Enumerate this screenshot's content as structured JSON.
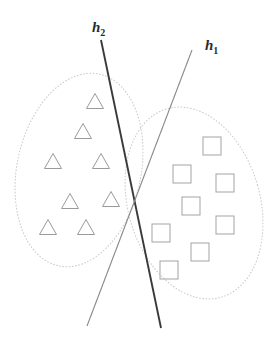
{
  "figure": {
    "width": 266,
    "height": 341,
    "background_color": "#ffffff"
  },
  "chart_data": {
    "type": "scatter",
    "title": "",
    "xlabel": "",
    "ylabel": "",
    "xlim": [
      0,
      266
    ],
    "ylim": [
      0,
      341
    ],
    "grid": false,
    "legend_position": "none",
    "note": "Coordinates are in image pixel space; y increases downward.",
    "series": [
      {
        "name": "class-triangle",
        "marker": "triangle",
        "marker_color": "#9a9a9a",
        "marker_size": 17,
        "points": [
          {
            "x": 95,
            "y": 101
          },
          {
            "x": 83,
            "y": 131
          },
          {
            "x": 53,
            "y": 161
          },
          {
            "x": 101,
            "y": 161
          },
          {
            "x": 70,
            "y": 201
          },
          {
            "x": 111,
            "y": 199
          },
          {
            "x": 48,
            "y": 227
          },
          {
            "x": 86,
            "y": 227
          }
        ]
      },
      {
        "name": "class-square",
        "marker": "square",
        "marker_color": "#a3a3a3",
        "marker_size": 18,
        "points": [
          {
            "x": 212,
            "y": 146
          },
          {
            "x": 182,
            "y": 174
          },
          {
            "x": 225,
            "y": 183
          },
          {
            "x": 191,
            "y": 206
          },
          {
            "x": 225,
            "y": 225
          },
          {
            "x": 161,
            "y": 233
          },
          {
            "x": 200,
            "y": 252
          },
          {
            "x": 169,
            "y": 270
          }
        ]
      }
    ],
    "clusters": [
      {
        "name": "triangle-cluster-ellipse",
        "center": {
          "x": 79,
          "y": 170
        },
        "rx": 62,
        "ry": 98,
        "rotation_deg": 12,
        "stroke": "#c9c9c9",
        "dashed": true
      },
      {
        "name": "square-cluster-ellipse",
        "center": {
          "x": 194,
          "y": 203
        },
        "rx": 66,
        "ry": 98,
        "rotation_deg": -16,
        "stroke": "#c9c9c9",
        "dashed": true
      }
    ],
    "decision_boundaries": [
      {
        "name": "h2",
        "label": "h",
        "subscript": "2",
        "label_x": 92,
        "label_y": 32,
        "x1": 101,
        "y1": 40,
        "x2": 161,
        "y2": 328,
        "stroke": "#3a3a3a",
        "stroke_width": 1.9
      },
      {
        "name": "h1",
        "label": "h",
        "subscript": "1",
        "label_x": 205,
        "label_y": 50,
        "x1": 192,
        "y1": 50,
        "x2": 87,
        "y2": 326,
        "stroke": "#8a8a8a",
        "stroke_width": 1.1
      }
    ],
    "intersection": {
      "x": 133,
      "y": 196
    }
  }
}
